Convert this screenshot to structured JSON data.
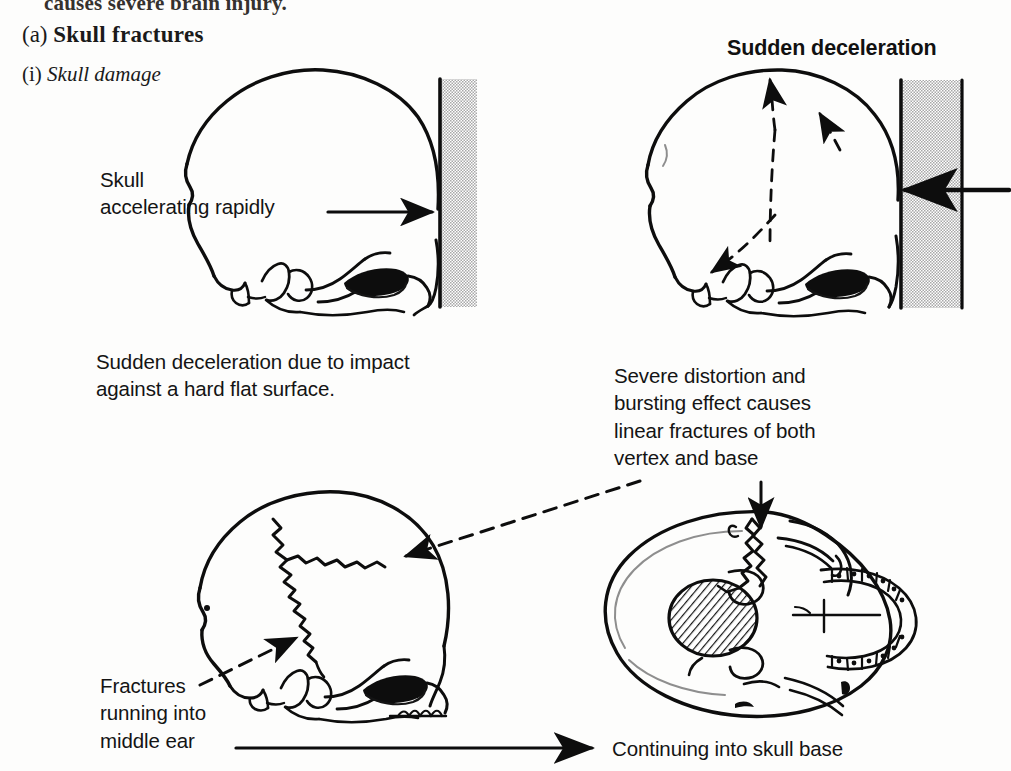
{
  "figure": {
    "cut_top_line": "causes severe brain injury.",
    "section_marker": "(a)",
    "section_title": "Skull fractures",
    "sub_marker": "(i)",
    "sub_title": "Skull damage"
  },
  "labels": {
    "sudden_deceleration_heading": "Sudden deceleration",
    "skull_accelerating": "Skull\naccelerating rapidly",
    "sudden_deceleration_caption": "Sudden deceleration due to impact\nagainst a hard flat surface.",
    "severe_distortion": "Severe distortion and\nbursting effect causes\nlinear fractures of both\nvertex and base",
    "fractures_middle_ear": "Fractures\nrunning into\nmiddle ear",
    "continuing_into_base": "Continuing into skull base"
  },
  "panels": [
    {
      "id": "top-left",
      "name": "skull-lateral-impacting-wall",
      "view": "lateral",
      "facing": "right",
      "wall": "stippled-hard-flat-surface",
      "arrow": "solid-right-arrow-skull-accelerating"
    },
    {
      "id": "top-right",
      "name": "skull-lateral-sudden-deceleration",
      "view": "lateral",
      "facing": "right",
      "wall": "stippled-hard-flat-surface",
      "arrows": [
        "dashed-force-vectors-radiating",
        "solid-left-arrow-impact"
      ]
    },
    {
      "id": "bottom-left",
      "name": "skull-lateral-linear-fractures",
      "view": "lateral",
      "facing": "right",
      "features": [
        "jagged-linear-fractures-vault",
        "fracture-into-middle-ear"
      ]
    },
    {
      "id": "bottom-right",
      "name": "skull-base-inferior-view",
      "view": "basal",
      "features": [
        "foramen-magnum-hatched",
        "dental-arch-teeth",
        "jagged-fracture-into-base"
      ]
    }
  ],
  "colors": {
    "ink": "#0d0d0d",
    "stipple": "#b9b9b9",
    "paper": "#fdfdfc",
    "faint_ink": "#8e8e8e"
  }
}
